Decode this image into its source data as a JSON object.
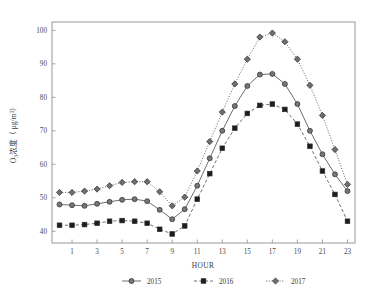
{
  "chart_data": {
    "type": "line",
    "title": "",
    "xlabel": "HOUR",
    "ylabel_main": "O",
    "ylabel_sub": "3",
    "ylabel_rest": "浓度（ μg/m",
    "ylabel_sup": "3",
    "ylabel_close": "）",
    "ylabel_full": "O₃浓度（ μg/m³）",
    "x": [
      0,
      1,
      2,
      3,
      4,
      5,
      6,
      7,
      8,
      9,
      10,
      11,
      12,
      13,
      14,
      15,
      16,
      17,
      18,
      19,
      20,
      21,
      22,
      23
    ],
    "xtick_values": [
      1,
      3,
      5,
      7,
      9,
      11,
      13,
      15,
      17,
      19,
      21,
      23
    ],
    "xtick_labels": [
      "1",
      "3",
      "5",
      "7",
      "9",
      "11",
      "13",
      "15",
      "17",
      "19",
      "21",
      "23"
    ],
    "ytick_values": [
      40,
      50,
      60,
      70,
      80,
      90,
      100
    ],
    "ytick_labels": [
      "40",
      "50",
      "60",
      "70",
      "80",
      "90",
      "100"
    ],
    "xlim": [
      -0.6,
      23.6
    ],
    "ylim": [
      36.5,
      102.5
    ],
    "grid": false,
    "legend_position": "below",
    "series": [
      {
        "name": "2015",
        "label": "2015",
        "marker": "circle",
        "dash": "solid",
        "color": "#777777",
        "values": [
          48.0,
          47.8,
          47.6,
          48.2,
          48.8,
          49.4,
          49.6,
          49.0,
          46.4,
          43.6,
          46.6,
          53.6,
          61.8,
          70.0,
          77.4,
          83.4,
          86.8,
          87.0,
          84.0,
          78.0,
          70.0,
          63.0,
          57.0,
          52.0
        ]
      },
      {
        "name": "2016",
        "label": "2016",
        "marker": "square",
        "dash": "dashed",
        "color": "#1d1d1d",
        "values": [
          41.8,
          41.8,
          42.0,
          42.4,
          43.0,
          43.2,
          43.0,
          42.4,
          40.6,
          39.2,
          41.6,
          49.6,
          57.2,
          64.8,
          70.8,
          75.2,
          77.6,
          78.0,
          76.4,
          72.0,
          65.4,
          58.0,
          51.0,
          43.0
        ]
      },
      {
        "name": "2017",
        "label": "2017",
        "marker": "diamond",
        "dash": "dotted",
        "color": "#6f6f6f",
        "values": [
          51.6,
          51.6,
          52.0,
          52.6,
          53.6,
          54.6,
          54.8,
          54.8,
          51.8,
          47.6,
          50.2,
          58.0,
          66.8,
          75.6,
          84.0,
          91.4,
          98.0,
          99.2,
          96.6,
          91.4,
          83.6,
          74.6,
          64.4,
          54.0
        ]
      }
    ]
  },
  "legend": {
    "items": [
      {
        "label": "2015"
      },
      {
        "label": "2016"
      },
      {
        "label": "2017"
      }
    ]
  }
}
